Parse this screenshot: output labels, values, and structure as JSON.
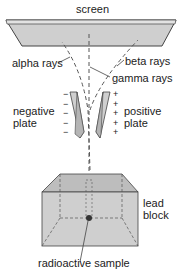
{
  "diagram": {
    "labels": {
      "screen": "screen",
      "alpha": "alpha rays",
      "beta": "beta rays",
      "gamma": "gamma rays",
      "negative_line1": "negative",
      "negative_line2": "plate",
      "positive_line1": "positive",
      "positive_line2": "plate",
      "lead_line1": "lead",
      "lead_line2": "block",
      "sample": "radioactive sample"
    },
    "charges": {
      "negative": [
        "−",
        "−",
        "−",
        "−",
        "−"
      ],
      "positive": [
        "+",
        "+",
        "+",
        "+",
        "+"
      ]
    },
    "colors": {
      "fill": "#cfcfcf",
      "fill_dark": "#b5b5b5",
      "stroke": "#444444",
      "text": "#222222"
    }
  }
}
